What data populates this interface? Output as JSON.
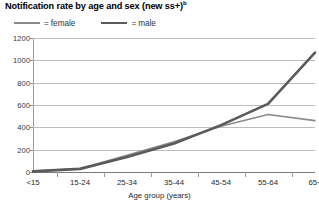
{
  "chart_data": {
    "type": "line",
    "title": "Notification rate by age and sex (new ss+)",
    "title_superscript": "b",
    "xlabel": "Age group (years)",
    "ylabel": "",
    "categories": [
      "<15",
      "15-24",
      "25-34",
      "35-44",
      "45-54",
      "55-64",
      "65+"
    ],
    "series": [
      {
        "name": "female",
        "values": [
          8,
          30,
          150,
          270,
          410,
          515,
          460
        ],
        "color": "#8a8a8a",
        "line_width": 1.6
      },
      {
        "name": "male",
        "values": [
          6,
          28,
          135,
          255,
          420,
          610,
          1070
        ],
        "color": "#5a5a5a",
        "line_width": 2.6
      }
    ],
    "ylim": [
      0,
      1200
    ],
    "ytick_values": [
      0,
      200,
      400,
      600,
      800,
      1000,
      1200
    ],
    "ytick_labels": [
      "0",
      "200",
      "400",
      "600",
      "800",
      "1000",
      "1200"
    ],
    "grid": true,
    "grid_axis": "y",
    "legend_position": "top-left",
    "legend_separator": "="
  },
  "colors": {
    "grid": "#bdbdbd",
    "axis": "#9a9a9a",
    "text": "#2a2a2a"
  }
}
